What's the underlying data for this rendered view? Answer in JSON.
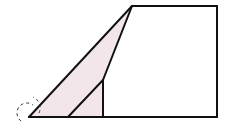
{
  "diagram": {
    "type": "geometry",
    "colors": {
      "stroke": "#111111",
      "shade": "#f3e6ea",
      "background": "#ffffff"
    },
    "points": {
      "A": [
        29,
        117
      ],
      "B": [
        68,
        117
      ],
      "C": [
        103,
        117
      ],
      "D": [
        217,
        117
      ],
      "E": [
        217,
        6
      ],
      "F": [
        132,
        6
      ],
      "G": [
        103,
        80
      ]
    },
    "shaded_region": [
      "A",
      "F",
      "G",
      "C"
    ],
    "segments": [
      [
        "A",
        "D"
      ],
      [
        "D",
        "E"
      ],
      [
        "E",
        "F"
      ],
      [
        "F",
        "A"
      ],
      [
        "F",
        "G"
      ],
      [
        "G",
        "C"
      ],
      [
        "B",
        "G"
      ]
    ],
    "angle_marks": [
      {
        "vertex": "A",
        "style": "dashed-arc",
        "count": 2
      }
    ]
  }
}
